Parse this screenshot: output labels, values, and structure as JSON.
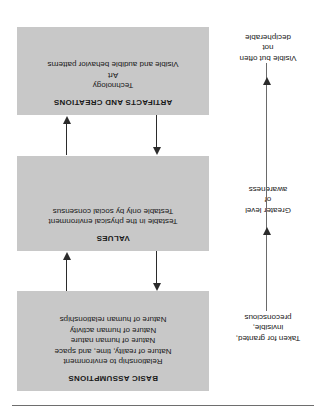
{
  "figure": {
    "orientation": "upside-down",
    "background_color": "#ffffff",
    "box_fill_color": "#c8c8c8",
    "line_color": "#2b2b2b",
    "levels": [
      {
        "id": "basic-assumptions",
        "title": "BASIC ASSUMPTIONS",
        "lines": [
          "Relationship to environment",
          "Nature of reality, time, and space",
          "Nature of human nature",
          "Nature of human activity",
          "Nature of human relationships"
        ],
        "caption": [
          "Taken for granted,",
          "invisible,",
          "preconscious"
        ]
      },
      {
        "id": "values",
        "title": "VALUES",
        "lines": [
          "Testable in the physical environment",
          "Testable only by social consensus"
        ],
        "caption": [
          "Greater level",
          "of",
          "awareness"
        ]
      },
      {
        "id": "artifacts-and-creations",
        "title": "ARTIFACTS AND CREATIONS",
        "lines": [
          "Technology",
          "Art",
          "Visible and audible behavior patterns"
        ],
        "caption": [
          "Visible but often",
          "not",
          "decipherable"
        ]
      }
    ],
    "connectors": [
      {
        "id": "artifacts-to-values-up",
        "direction": "up"
      },
      {
        "id": "values-to-artifacts-down",
        "direction": "down"
      },
      {
        "id": "values-to-basic-up",
        "direction": "up"
      },
      {
        "id": "basic-to-values-down",
        "direction": "down"
      }
    ]
  }
}
